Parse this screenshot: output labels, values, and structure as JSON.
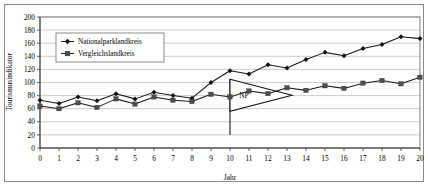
{
  "chart_data": {
    "type": "line",
    "title": "",
    "xlabel": "Jahr",
    "ylabel": "Tourismusindikator",
    "xlim": [
      0,
      20
    ],
    "ylim": [
      0,
      200
    ],
    "ytick_step": 20,
    "xtick_step": 1,
    "grid": true,
    "legend_position": "upper-left-inside",
    "x": [
      0,
      1,
      2,
      3,
      4,
      5,
      6,
      7,
      8,
      9,
      10,
      11,
      12,
      13,
      14,
      15,
      16,
      17,
      18,
      19,
      20
    ],
    "xtick_labels": [
      "0",
      "1",
      "2",
      "3",
      "4",
      "5",
      "6",
      "7",
      "8",
      "9",
      "10",
      "11",
      "12",
      "13",
      "14",
      "15",
      "16",
      "17",
      "18",
      "19",
      "20"
    ],
    "ytick_labels": [
      "0",
      "20",
      "40",
      "60",
      "80",
      "100",
      "120",
      "140",
      "160",
      "180",
      "200"
    ],
    "series": [
      {
        "name": "Nationalparklandkreis",
        "marker": "diamond",
        "color": "#131313",
        "values": [
          73,
          68,
          78,
          72,
          83,
          75,
          85,
          80,
          76,
          100,
          118,
          113,
          127,
          122,
          135,
          146,
          141,
          152,
          158,
          170,
          167
        ]
      },
      {
        "name": "Vergleichslandkreis",
        "marker": "square",
        "color": "#4d4d4d",
        "values": [
          64,
          60,
          69,
          62,
          75,
          67,
          78,
          73,
          71,
          82,
          78,
          87,
          83,
          92,
          88,
          95,
          91,
          99,
          103,
          98,
          108
        ]
      }
    ],
    "annotations": [
      {
        "name": "np-flag",
        "label": "NP",
        "x": 10,
        "shape": "pennant-flag",
        "pole_top": 105,
        "pole_bottom": 20
      }
    ]
  },
  "legend": {
    "entries": [
      {
        "label": "Nationalparklandkreis"
      },
      {
        "label": "Vergleichslandkreis"
      }
    ]
  }
}
